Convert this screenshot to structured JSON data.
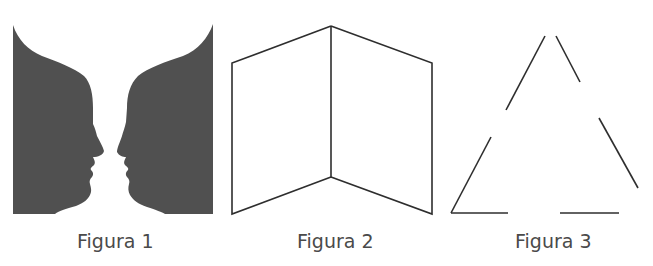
{
  "figures": [
    {
      "id": "figura-1",
      "caption": "Figura 1",
      "description": "Rubin vase illusion: two facing silhouette profiles",
      "fill_color": "#505050"
    },
    {
      "id": "figura-2",
      "caption": "Figura 2",
      "description": "Ambiguous folded-card (Mach book) line drawing",
      "stroke_color": "#2e2e2e"
    },
    {
      "id": "figura-3",
      "caption": "Figura 3",
      "description": "Illusory triangle made of six disconnected line segments",
      "stroke_color": "#2e2e2e"
    }
  ],
  "colors": {
    "background": "#ffffff",
    "caption_text": "#4a4a4a"
  }
}
